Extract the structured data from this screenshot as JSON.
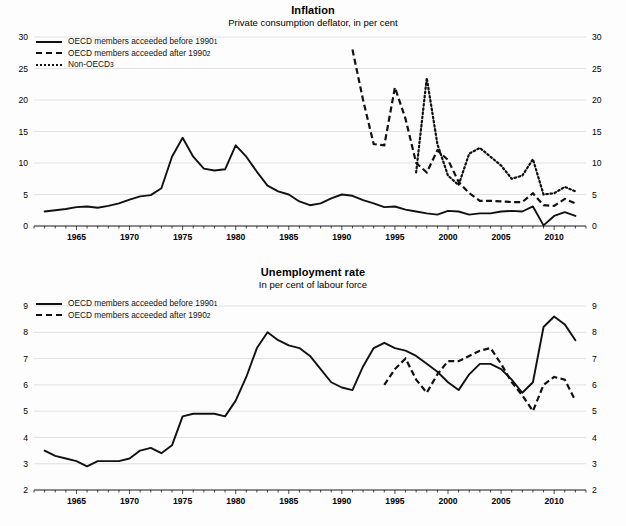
{
  "page": {
    "background": "#fdfdfd",
    "ink": "#111111",
    "grid_color": "#d6d6d6"
  },
  "chart_data": [
    {
      "id": "inflation",
      "type": "line",
      "title": "Inflation",
      "subtitle": "Private consumption deflator, in per cent",
      "xlabel": "",
      "ylabel": "",
      "xlim": [
        1961,
        2013
      ],
      "ylim": [
        0,
        30
      ],
      "yticks": [
        0,
        5,
        10,
        15,
        20,
        25,
        30
      ],
      "xticks": [
        1965,
        1970,
        1975,
        1980,
        1985,
        1990,
        1995,
        2000,
        2005,
        2010
      ],
      "xtick_step_minor": 1,
      "grid": true,
      "dual_y_axis": true,
      "legend_position": "top-left",
      "legend": [
        {
          "label": "OECD members acceeded before 1990",
          "note": "1",
          "style": "solid"
        },
        {
          "label": "OECD members acceeded after 1990",
          "note": "2",
          "style": "dashed"
        },
        {
          "label": "Non-OECD",
          "note": "3",
          "style": "dotted"
        }
      ],
      "series": [
        {
          "name": "OECD members acceeded before 1990",
          "style": "solid",
          "x": [
            1962,
            1963,
            1964,
            1965,
            1966,
            1967,
            1968,
            1969,
            1970,
            1971,
            1972,
            1973,
            1974,
            1975,
            1976,
            1977,
            1978,
            1979,
            1980,
            1981,
            1982,
            1983,
            1984,
            1985,
            1986,
            1987,
            1988,
            1989,
            1990,
            1991,
            1992,
            1993,
            1994,
            1995,
            1996,
            1997,
            1998,
            1999,
            2000,
            2001,
            2002,
            2003,
            2004,
            2005,
            2006,
            2007,
            2008,
            2009,
            2010,
            2011,
            2012
          ],
          "values": [
            2.3,
            2.5,
            2.7,
            3.0,
            3.1,
            2.9,
            3.2,
            3.6,
            4.2,
            4.7,
            4.9,
            6.0,
            11.0,
            14.0,
            11.0,
            9.1,
            8.8,
            9.0,
            12.8,
            11.0,
            8.6,
            6.4,
            5.5,
            5.0,
            3.9,
            3.3,
            3.6,
            4.4,
            5.0,
            4.8,
            4.1,
            3.6,
            3.0,
            3.1,
            2.6,
            2.3,
            2.0,
            1.8,
            2.4,
            2.3,
            1.8,
            2.0,
            2.0,
            2.3,
            2.4,
            2.3,
            3.1,
            0.1,
            1.6,
            2.2,
            1.6
          ]
        },
        {
          "name": "OECD members acceeded after 1990",
          "style": "dashed",
          "x": [
            1991,
            1992,
            1993,
            1994,
            1995,
            1996,
            1997,
            1998,
            1999,
            2000,
            2001,
            2002,
            2003,
            2004,
            2005,
            2006,
            2007,
            2008,
            2009,
            2010,
            2011,
            2012
          ],
          "values": [
            28.0,
            20.0,
            13.0,
            12.8,
            22.0,
            17.0,
            10.0,
            8.5,
            12.0,
            10.5,
            7.0,
            5.2,
            4.0,
            4.0,
            3.9,
            3.8,
            3.8,
            5.2,
            3.3,
            3.2,
            4.3,
            3.6
          ]
        },
        {
          "name": "Non-OECD",
          "style": "dotted",
          "x": [
            1997,
            1998,
            1999,
            2000,
            2001,
            2002,
            2003,
            2004,
            2005,
            2006,
            2007,
            2008,
            2009,
            2010,
            2011,
            2012
          ],
          "values": [
            8.5,
            23.5,
            13.0,
            8.0,
            6.5,
            11.5,
            12.4,
            11.0,
            9.6,
            7.5,
            8.0,
            10.6,
            5.0,
            5.2,
            6.2,
            5.5
          ]
        }
      ]
    },
    {
      "id": "unemployment",
      "type": "line",
      "title": "Unemployment rate",
      "subtitle": "In per cent of labour force",
      "xlabel": "",
      "ylabel": "",
      "xlim": [
        1961,
        2013
      ],
      "ylim": [
        2,
        9
      ],
      "yticks": [
        2,
        3,
        4,
        5,
        6,
        7,
        8,
        9
      ],
      "xticks": [
        1965,
        1970,
        1975,
        1980,
        1985,
        1990,
        1995,
        2000,
        2005,
        2010
      ],
      "xtick_step_minor": 1,
      "grid": true,
      "dual_y_axis": true,
      "legend_position": "top-left",
      "legend": [
        {
          "label": "OECD members acceeded before 1990",
          "note": "1",
          "style": "solid"
        },
        {
          "label": "OECD members acceeded after 1990",
          "note": "2",
          "style": "dashed"
        }
      ],
      "series": [
        {
          "name": "OECD members acceeded before 1990",
          "style": "solid",
          "x": [
            1962,
            1963,
            1964,
            1965,
            1966,
            1967,
            1968,
            1969,
            1970,
            1971,
            1972,
            1973,
            1974,
            1975,
            1976,
            1977,
            1978,
            1979,
            1980,
            1981,
            1982,
            1983,
            1984,
            1985,
            1986,
            1987,
            1988,
            1989,
            1990,
            1991,
            1992,
            1993,
            1994,
            1995,
            1996,
            1997,
            1998,
            1999,
            2000,
            2001,
            2002,
            2003,
            2004,
            2005,
            2006,
            2007,
            2008,
            2009,
            2010,
            2011,
            2012
          ],
          "values": [
            3.5,
            3.3,
            3.2,
            3.1,
            2.9,
            3.1,
            3.1,
            3.1,
            3.2,
            3.5,
            3.6,
            3.4,
            3.7,
            4.8,
            4.9,
            4.9,
            4.9,
            4.8,
            5.4,
            6.3,
            7.4,
            8.0,
            7.7,
            7.5,
            7.4,
            7.1,
            6.6,
            6.1,
            5.9,
            5.8,
            6.7,
            7.4,
            7.6,
            7.4,
            7.3,
            7.1,
            6.8,
            6.5,
            6.1,
            5.8,
            6.4,
            6.8,
            6.8,
            6.6,
            6.2,
            5.7,
            6.1,
            8.2,
            8.6,
            8.3,
            7.7
          ]
        },
        {
          "name": "OECD members acceeded after 1990",
          "style": "dashed",
          "x": [
            1994,
            1995,
            1996,
            1997,
            1998,
            1999,
            2000,
            2001,
            2002,
            2003,
            2004,
            2005,
            2006,
            2007,
            2008,
            2009,
            2010,
            2011,
            2012
          ],
          "values": [
            6.0,
            6.6,
            7.0,
            6.2,
            5.7,
            6.4,
            6.9,
            6.9,
            7.1,
            7.3,
            7.4,
            6.8,
            6.1,
            5.6,
            5.0,
            6.0,
            6.3,
            6.2,
            5.4
          ]
        }
      ]
    }
  ]
}
